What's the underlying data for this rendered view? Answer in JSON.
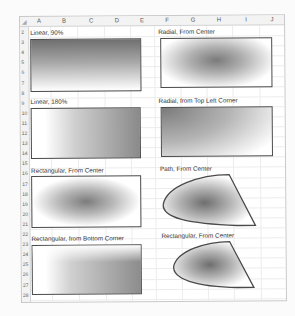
{
  "spreadsheet": {
    "columns": [
      "A",
      "B",
      "C",
      "D",
      "E",
      "F",
      "G",
      "H",
      "I",
      "J"
    ],
    "rows": [
      "2",
      "3",
      "4",
      "5",
      "6",
      "7",
      "8",
      "9",
      "10",
      "11",
      "12",
      "13",
      "14",
      "15",
      "16",
      "17",
      "18",
      "19",
      "20",
      "21",
      "22",
      "23",
      "24",
      "25",
      "26",
      "27",
      "28",
      "29"
    ]
  },
  "examples": [
    {
      "label": "Linear, 90%",
      "fill": "linear-vertical",
      "shape": "rectangle"
    },
    {
      "label": "Radial, From Center",
      "fill": "radial-center",
      "shape": "rectangle"
    },
    {
      "label": "Linear, 180%",
      "fill": "linear-horizontal",
      "shape": "rectangle"
    },
    {
      "label": "Radial, from Top Left Corner",
      "fill": "radial-top-left",
      "shape": "rectangle"
    },
    {
      "label": "Rectangular, From Center",
      "fill": "rectangular-center",
      "shape": "rectangle"
    },
    {
      "label": "Path, From Center",
      "fill": "path-center",
      "shape": "freeform"
    },
    {
      "label": "Rectangular, from Bottom Corner",
      "fill": "rectangular-bottom-corner",
      "shape": "rectangle"
    },
    {
      "label": "Rectangular, From Center",
      "fill": "rectangular-center",
      "shape": "freeform"
    }
  ],
  "colors": {
    "outline": "#4a4a4a",
    "gradient_dark": "#707070",
    "gradient_light": "#ffffff",
    "grid": "#ececec"
  }
}
